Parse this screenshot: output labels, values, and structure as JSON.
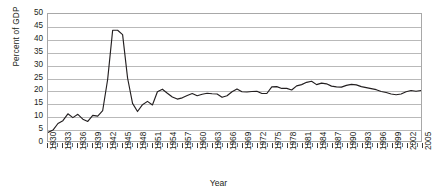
{
  "chart_data": {
    "type": "line",
    "title": "",
    "xlabel": "Year",
    "ylabel": "Percent of GDP",
    "xlim": [
      1930,
      2005
    ],
    "ylim": [
      0,
      50
    ],
    "ytick_step": 5,
    "yticks": [
      0,
      5,
      10,
      15,
      20,
      25,
      30,
      35,
      40,
      45,
      50
    ],
    "xticks": [
      1930,
      1933,
      1936,
      1939,
      1942,
      1945,
      1948,
      1951,
      1954,
      1957,
      1960,
      1963,
      1966,
      1969,
      1972,
      1975,
      1978,
      1981,
      1984,
      1987,
      1990,
      1993,
      1996,
      1999,
      2002,
      2005
    ],
    "grid": true,
    "legend": "none",
    "line_color": "#231f20",
    "series": [
      {
        "name": "Federal spending",
        "x": [
          1930,
          1931,
          1932,
          1933,
          1934,
          1935,
          1936,
          1937,
          1938,
          1939,
          1940,
          1941,
          1942,
          1943,
          1944,
          1945,
          1946,
          1947,
          1948,
          1949,
          1950,
          1951,
          1952,
          1953,
          1954,
          1955,
          1956,
          1957,
          1958,
          1959,
          1960,
          1961,
          1962,
          1963,
          1964,
          1965,
          1966,
          1967,
          1968,
          1969,
          1970,
          1971,
          1972,
          1973,
          1974,
          1975,
          1976,
          1977,
          1978,
          1979,
          1980,
          1981,
          1982,
          1983,
          1984,
          1985,
          1986,
          1987,
          1988,
          1989,
          1990,
          1991,
          1992,
          1993,
          1994,
          1995,
          1996,
          1997,
          1998,
          1999,
          2000,
          2001,
          2002,
          2003,
          2004,
          2005
        ],
        "values": [
          3.4,
          4.3,
          6.9,
          8.0,
          10.7,
          9.2,
          10.5,
          8.6,
          7.7,
          10.1,
          9.8,
          12.0,
          24.3,
          43.6,
          43.6,
          41.9,
          24.8,
          14.8,
          11.6,
          14.3,
          15.6,
          14.2,
          19.4,
          20.4,
          18.8,
          17.3,
          16.5,
          17.0,
          17.9,
          18.7,
          17.8,
          18.4,
          18.8,
          18.6,
          18.5,
          17.2,
          17.8,
          19.4,
          20.5,
          19.4,
          19.3,
          19.5,
          19.6,
          18.7,
          18.7,
          21.3,
          21.4,
          20.7,
          20.7,
          20.1,
          21.7,
          22.2,
          23.1,
          23.5,
          22.2,
          22.8,
          22.5,
          21.6,
          21.3,
          21.2,
          21.9,
          22.3,
          22.1,
          21.4,
          21.0,
          20.6,
          20.2,
          19.5,
          19.1,
          18.5,
          18.2,
          18.5,
          19.4,
          19.9,
          19.6,
          19.9
        ]
      }
    ]
  },
  "axis": {
    "y_title": "Percent of GDP",
    "x_title": "Year"
  }
}
